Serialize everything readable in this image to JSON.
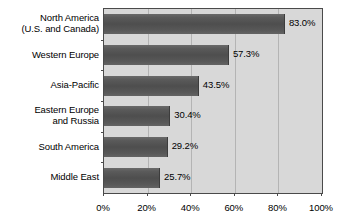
{
  "chart_data": {
    "type": "bar",
    "orientation": "horizontal",
    "title": "",
    "subtitle": "",
    "xlabel": "",
    "ylabel": "",
    "categories": [
      "North America\n(U.S. and Canada)",
      "Western Europe",
      "Asia-Pacific",
      "Eastern Europe\nand Russia",
      "South America",
      "Middle East"
    ],
    "category_lines": [
      [
        "North America",
        "(U.S. and Canada)"
      ],
      [
        "Western Europe",
        ""
      ],
      [
        "Asia-Pacific",
        ""
      ],
      [
        "Eastern Europe",
        "and Russia"
      ],
      [
        "South America",
        ""
      ],
      [
        "Middle East",
        ""
      ]
    ],
    "values": [
      83.0,
      57.3,
      43.5,
      30.4,
      29.2,
      25.7
    ],
    "data_labels": [
      "83.0%",
      "57.3%",
      "43.5%",
      "30.4%",
      "29.2%",
      "25.7%"
    ],
    "xlim": [
      0,
      100
    ],
    "xticks": [
      0,
      20,
      40,
      60,
      80,
      100
    ],
    "xtick_labels": [
      "0%",
      "20%",
      "40%",
      "60%",
      "80%",
      "100%"
    ],
    "grid": true,
    "grid_axis": "x",
    "legend": false,
    "legend_position": "none",
    "bar_color": "#555555",
    "plot_background": "#d8d8d8",
    "gridline_color": "#b4b4b4",
    "border_color": "#4a4a4a",
    "page_background": "#ffffff",
    "text_color": "#000000"
  }
}
